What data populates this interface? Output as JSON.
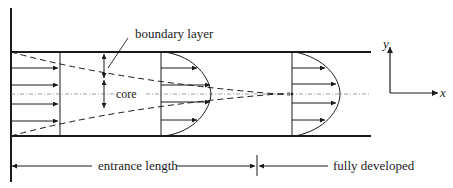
{
  "diagram": {
    "labels": {
      "boundary_layer": "boundary layer",
      "core": "core",
      "entrance_length": "entrance length",
      "fully_developed": "fully developed",
      "axis_x": "x",
      "axis_y": "y"
    },
    "regions": [
      {
        "name": "entrance region",
        "profile": "uniform core with growing boundary layer"
      },
      {
        "name": "fully developed region",
        "profile": "parabolic"
      }
    ],
    "colors": {
      "line": "#1a1a1a",
      "centerline": "#888888",
      "background": "#ffffff"
    }
  }
}
